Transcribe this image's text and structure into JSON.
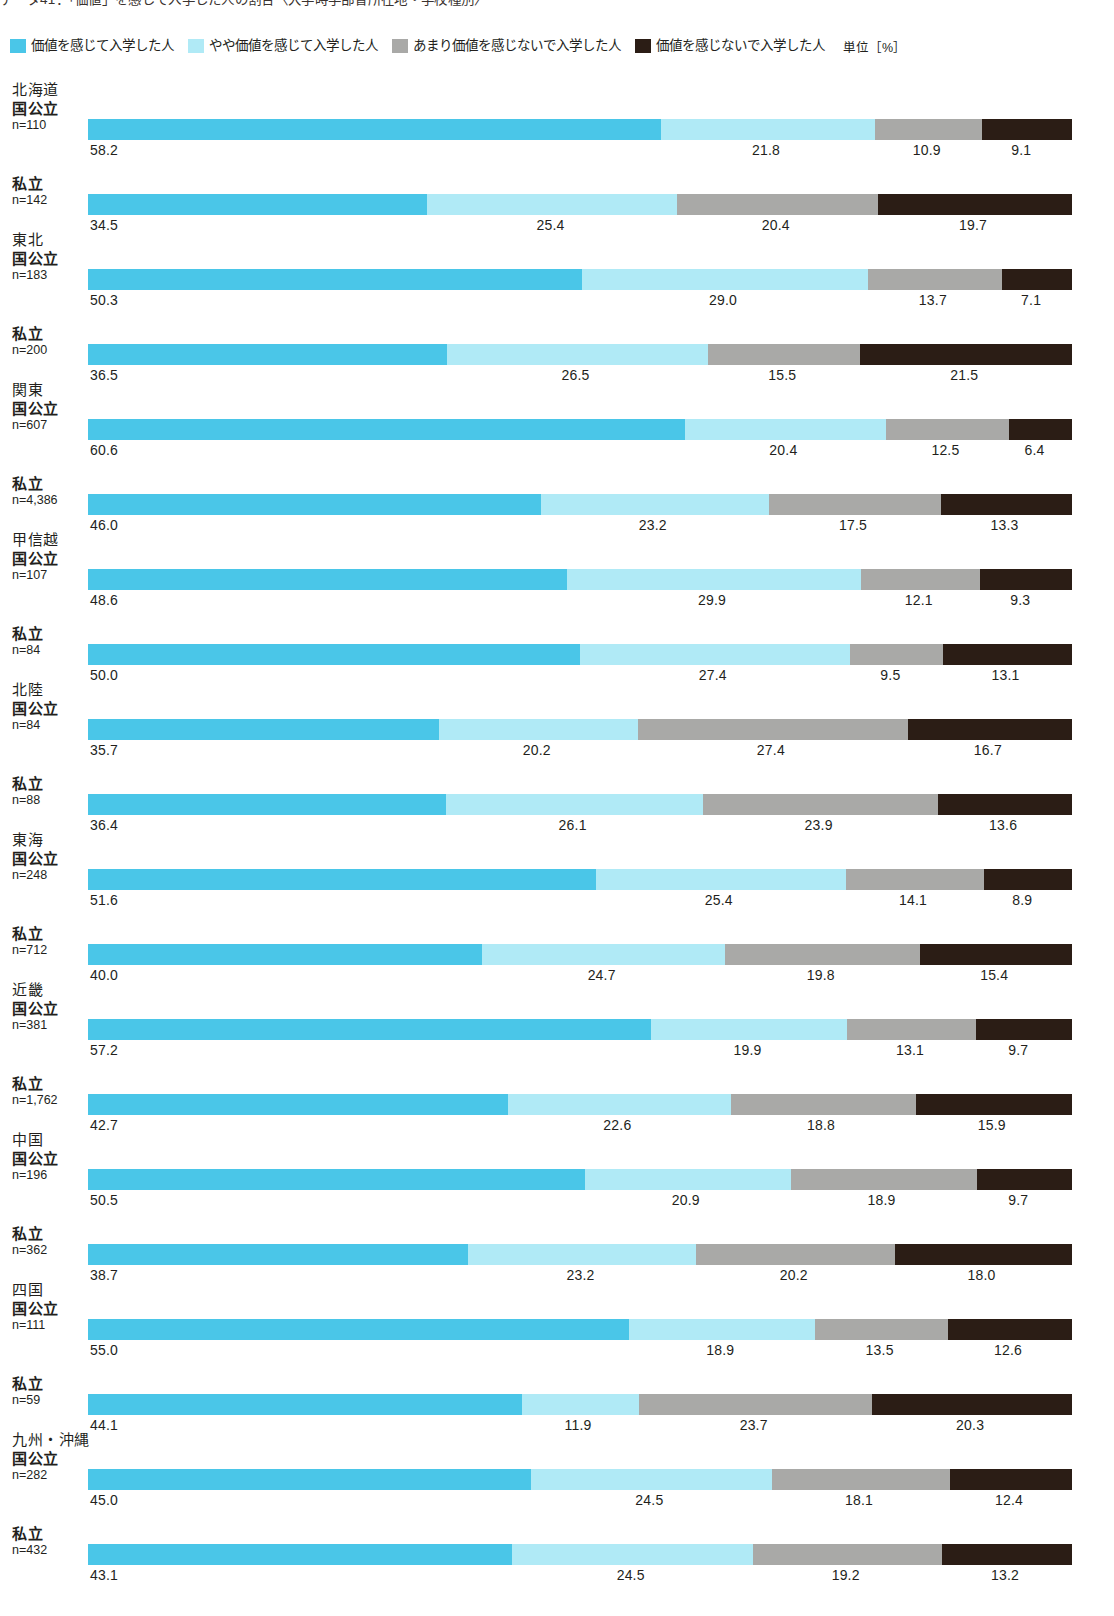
{
  "title": "データ41：「価値」を感じて入学した人の割合〈大学時学部省所在地・学校種別〉",
  "legend": {
    "items": [
      {
        "label": "価値を感じて入学した人",
        "color": "#4ac6e8",
        "key": "felt-value"
      },
      {
        "label": "やや価値を感じて入学した人",
        "color": "#b0eaf6",
        "key": "somewhat-felt-value"
      },
      {
        "label": "あまり価値を感じないで入学した人",
        "color": "#a9a9a7",
        "key": "not-much-value"
      },
      {
        "label": "価値を感じないで入学した人",
        "color": "#2b1d15",
        "key": "no-value"
      }
    ],
    "unit": "単位［%］"
  },
  "chart_data": {
    "type": "bar",
    "subtype": "stacked-horizontal-100",
    "title": "データ41：「価値」を感じて入学した人の割合〈大学時学部省所在地・学校種別〉",
    "xlabel": "",
    "ylabel": "",
    "xlim": [
      0,
      100
    ],
    "grid": false,
    "legend_position": "top",
    "series": [
      {
        "name": "価値を感じて入学した人",
        "color": "#4ac6e8"
      },
      {
        "name": "やや価値を感じて入学した人",
        "color": "#b0eaf6"
      },
      {
        "name": "あまり価値を感じないで入学した人",
        "color": "#a9a9a7"
      },
      {
        "name": "価値を感じないで入学した人",
        "color": "#2b1d15"
      }
    ],
    "regions": [
      {
        "region": "北海道",
        "rows": [
          {
            "school_type": "国公立",
            "n_label": "n=110",
            "values": [
              58.2,
              21.8,
              10.9,
              9.1
            ]
          },
          {
            "school_type": "私立",
            "n_label": "n=142",
            "values": [
              34.5,
              25.4,
              20.4,
              19.7
            ]
          }
        ]
      },
      {
        "region": "東北",
        "rows": [
          {
            "school_type": "国公立",
            "n_label": "n=183",
            "values": [
              50.3,
              29.0,
              13.7,
              7.1
            ]
          },
          {
            "school_type": "私立",
            "n_label": "n=200",
            "values": [
              36.5,
              26.5,
              15.5,
              21.5
            ]
          }
        ]
      },
      {
        "region": "関東",
        "rows": [
          {
            "school_type": "国公立",
            "n_label": "n=607",
            "values": [
              60.6,
              20.4,
              12.5,
              6.4
            ]
          },
          {
            "school_type": "私立",
            "n_label": "n=4,386",
            "values": [
              46.0,
              23.2,
              17.5,
              13.3
            ]
          }
        ]
      },
      {
        "region": "甲信越",
        "rows": [
          {
            "school_type": "国公立",
            "n_label": "n=107",
            "values": [
              48.6,
              29.9,
              12.1,
              9.3
            ]
          },
          {
            "school_type": "私立",
            "n_label": "n=84",
            "values": [
              50.0,
              27.4,
              9.5,
              13.1
            ]
          }
        ]
      },
      {
        "region": "北陸",
        "rows": [
          {
            "school_type": "国公立",
            "n_label": "n=84",
            "values": [
              35.7,
              20.2,
              27.4,
              16.7
            ]
          },
          {
            "school_type": "私立",
            "n_label": "n=88",
            "values": [
              36.4,
              26.1,
              23.9,
              13.6
            ]
          }
        ]
      },
      {
        "region": "東海",
        "rows": [
          {
            "school_type": "国公立",
            "n_label": "n=248",
            "values": [
              51.6,
              25.4,
              14.1,
              8.9
            ]
          },
          {
            "school_type": "私立",
            "n_label": "n=712",
            "values": [
              40.0,
              24.7,
              19.8,
              15.4
            ]
          }
        ]
      },
      {
        "region": "近畿",
        "rows": [
          {
            "school_type": "国公立",
            "n_label": "n=381",
            "values": [
              57.2,
              19.9,
              13.1,
              9.7
            ]
          },
          {
            "school_type": "私立",
            "n_label": "n=1,762",
            "values": [
              42.7,
              22.6,
              18.8,
              15.9
            ]
          }
        ]
      },
      {
        "region": "中国",
        "rows": [
          {
            "school_type": "国公立",
            "n_label": "n=196",
            "values": [
              50.5,
              20.9,
              18.9,
              9.7
            ]
          },
          {
            "school_type": "私立",
            "n_label": "n=362",
            "values": [
              38.7,
              23.2,
              20.2,
              18.0
            ]
          }
        ]
      },
      {
        "region": "四国",
        "rows": [
          {
            "school_type": "国公立",
            "n_label": "n=111",
            "values": [
              55.0,
              18.9,
              13.5,
              12.6
            ]
          },
          {
            "school_type": "私立",
            "n_label": "n=59",
            "values": [
              44.1,
              11.9,
              23.7,
              20.3
            ]
          }
        ]
      },
      {
        "region": "九州・沖縄",
        "rows": [
          {
            "school_type": "国公立",
            "n_label": "n=282",
            "values": [
              45.0,
              24.5,
              18.1,
              12.4
            ]
          },
          {
            "school_type": "私立",
            "n_label": "n=432",
            "values": [
              43.1,
              24.5,
              19.2,
              13.2
            ]
          }
        ]
      }
    ]
  }
}
